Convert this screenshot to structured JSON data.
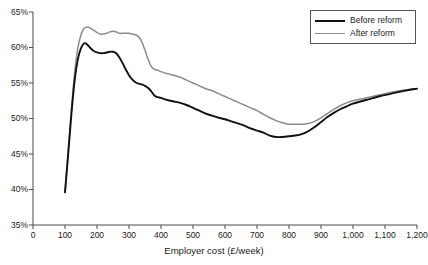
{
  "chart_data": {
    "type": "line",
    "title": "",
    "xlabel": "Employer cost (£/week)",
    "ylabel": "",
    "xlim": [
      0,
      1200
    ],
    "ylim": [
      35,
      65
    ],
    "grid": false,
    "legend_position": "top-right",
    "xticks": [
      0,
      100,
      200,
      300,
      400,
      500,
      600,
      700,
      800,
      900,
      1000,
      1100,
      1200
    ],
    "xtick_labels": [
      "0",
      "100",
      "200",
      "300",
      "400",
      "500",
      "600",
      "700",
      "800",
      "900",
      "1,000",
      "1,100",
      "1,200"
    ],
    "yticks": [
      35,
      40,
      45,
      50,
      55,
      60,
      65
    ],
    "ytick_labels": [
      "35%",
      "40%",
      "45%",
      "50%",
      "55%",
      "60%",
      "65%"
    ],
    "x": [
      100,
      110,
      120,
      130,
      140,
      150,
      160,
      170,
      180,
      190,
      200,
      210,
      220,
      230,
      240,
      250,
      260,
      270,
      280,
      290,
      300,
      310,
      320,
      330,
      340,
      350,
      360,
      370,
      380,
      390,
      400,
      420,
      440,
      460,
      480,
      500,
      520,
      540,
      560,
      580,
      600,
      620,
      640,
      660,
      680,
      700,
      720,
      740,
      760,
      780,
      800,
      820,
      840,
      860,
      880,
      900,
      920,
      940,
      960,
      980,
      1000,
      1040,
      1080,
      1120,
      1160,
      1200
    ],
    "series": [
      {
        "name": "Before reform",
        "color": "#111111",
        "values": [
          39.6,
          45.0,
          50.6,
          55.3,
          58.3,
          59.9,
          60.6,
          60.4,
          59.9,
          59.5,
          59.3,
          59.2,
          59.2,
          59.3,
          59.4,
          59.4,
          59.2,
          58.6,
          57.8,
          56.9,
          56.1,
          55.5,
          55.1,
          54.9,
          54.8,
          54.6,
          54.3,
          53.8,
          53.2,
          53.0,
          52.9,
          52.6,
          52.4,
          52.2,
          51.9,
          51.5,
          51.1,
          50.7,
          50.4,
          50.1,
          49.9,
          49.6,
          49.3,
          49.0,
          48.6,
          48.3,
          48.0,
          47.6,
          47.4,
          47.4,
          47.5,
          47.6,
          47.8,
          48.2,
          48.8,
          49.5,
          50.2,
          50.8,
          51.3,
          51.7,
          52.1,
          52.6,
          53.1,
          53.5,
          53.9,
          54.2
        ]
      },
      {
        "name": "After reform",
        "color": "#8c8c8c",
        "values": [
          39.6,
          45.4,
          51.3,
          56.4,
          59.9,
          61.8,
          62.7,
          62.9,
          62.7,
          62.4,
          62.1,
          61.9,
          61.9,
          62.0,
          62.2,
          62.3,
          62.2,
          62.0,
          62.0,
          62.0,
          62.0,
          61.9,
          61.8,
          61.5,
          60.8,
          59.6,
          58.3,
          57.3,
          56.9,
          56.8,
          56.6,
          56.3,
          56.1,
          55.8,
          55.4,
          55.0,
          54.6,
          54.2,
          53.9,
          53.5,
          53.1,
          52.7,
          52.3,
          51.9,
          51.5,
          51.1,
          50.6,
          50.1,
          49.7,
          49.4,
          49.2,
          49.2,
          49.2,
          49.3,
          49.6,
          50.1,
          50.7,
          51.3,
          51.8,
          52.2,
          52.5,
          52.9,
          53.3,
          53.7,
          54.0,
          54.2
        ]
      }
    ]
  },
  "legend": {
    "items": [
      {
        "label": "Before reform",
        "swatch": "before"
      },
      {
        "label": "After reform",
        "swatch": "after"
      }
    ]
  },
  "caption_sliver": ""
}
